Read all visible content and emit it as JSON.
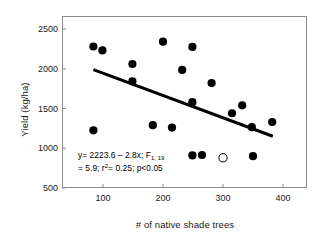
{
  "chart_data": {
    "type": "scatter",
    "title": "",
    "xlabel": "# of native shade trees",
    "ylabel": "Yield (kg/ha)",
    "xlim": [
      55,
      405
    ],
    "ylim": [
      500,
      2700
    ],
    "xticks": [
      100,
      200,
      300,
      400
    ],
    "yticks": [
      500,
      1000,
      1500,
      2000,
      2500
    ],
    "grid": false,
    "legend": "none",
    "series": [
      {
        "name": "observed",
        "marker": "filled-circle",
        "color": "#000000",
        "points": [
          {
            "x": 84,
            "y": 2280
          },
          {
            "x": 99,
            "y": 2230
          },
          {
            "x": 84,
            "y": 1225
          },
          {
            "x": 149,
            "y": 2060
          },
          {
            "x": 149,
            "y": 1840
          },
          {
            "x": 183,
            "y": 1290
          },
          {
            "x": 200,
            "y": 2340
          },
          {
            "x": 215,
            "y": 1260
          },
          {
            "x": 232,
            "y": 1985
          },
          {
            "x": 249,
            "y": 2275
          },
          {
            "x": 249,
            "y": 1580
          },
          {
            "x": 249,
            "y": 910
          },
          {
            "x": 265,
            "y": 915
          },
          {
            "x": 281,
            "y": 1820
          },
          {
            "x": 315,
            "y": 1440
          },
          {
            "x": 332,
            "y": 1540
          },
          {
            "x": 348,
            "y": 1265
          },
          {
            "x": 350,
            "y": 900
          },
          {
            "x": 382,
            "y": 1330
          }
        ]
      },
      {
        "name": "outlier-open",
        "marker": "open-circle",
        "color": "#000000",
        "points": [
          {
            "x": 300,
            "y": 880
          }
        ]
      }
    ],
    "fit_line": {
      "equation": "y = 2223.6 - 2.8x",
      "intercept": 2223.6,
      "slope": -2.8,
      "x_start": 84,
      "x_end": 383,
      "y_start": 1988,
      "y_end": 1151,
      "color": "#000000",
      "width": 3
    },
    "annotation": {
      "line1_a": "y= 2223.6 ",
      "line1_b": "– 2.8x; F",
      "line1_sub": "1, 19",
      "line2_a": "= 5.9; r",
      "line2_sup": "2",
      "line2_b": "= 0.25; p<0.05"
    },
    "statistics": {
      "F_statistic": 5.9,
      "df1": 1,
      "df2": 19,
      "r_squared": 0.25,
      "p_value": "<0.05"
    }
  },
  "axis": {
    "x_title": "# of native shade trees",
    "y_title": "Yield (kg/ha)",
    "x_tick_labels": [
      "100",
      "200",
      "300",
      "400"
    ],
    "y_tick_labels": [
      "2500",
      "2000",
      "1500",
      "1000",
      "500"
    ]
  }
}
